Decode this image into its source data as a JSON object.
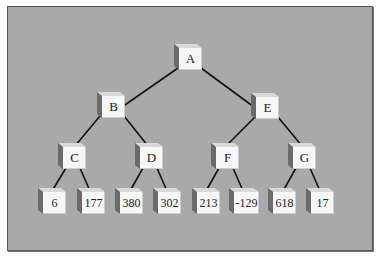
{
  "diagram": {
    "type": "binary-tree",
    "background_color": "#a9a9a9",
    "nodes": {
      "root": {
        "label": "A"
      },
      "b": {
        "label": "B"
      },
      "e": {
        "label": "E"
      },
      "c": {
        "label": "C"
      },
      "d": {
        "label": "D"
      },
      "f": {
        "label": "F"
      },
      "g": {
        "label": "G"
      },
      "leaves": [
        {
          "label": "6"
        },
        {
          "label": "177"
        },
        {
          "label": "380"
        },
        {
          "label": "302"
        },
        {
          "label": "213"
        },
        {
          "label": "-129"
        },
        {
          "label": "618"
        },
        {
          "label": "17"
        }
      ]
    },
    "edges": [
      [
        "A",
        "B"
      ],
      [
        "A",
        "E"
      ],
      [
        "B",
        "C"
      ],
      [
        "B",
        "D"
      ],
      [
        "E",
        "F"
      ],
      [
        "E",
        "G"
      ],
      [
        "C",
        "6"
      ],
      [
        "C",
        "177"
      ],
      [
        "D",
        "380"
      ],
      [
        "D",
        "302"
      ],
      [
        "F",
        "213"
      ],
      [
        "F",
        "-129"
      ],
      [
        "G",
        "618"
      ],
      [
        "G",
        "17"
      ]
    ]
  }
}
